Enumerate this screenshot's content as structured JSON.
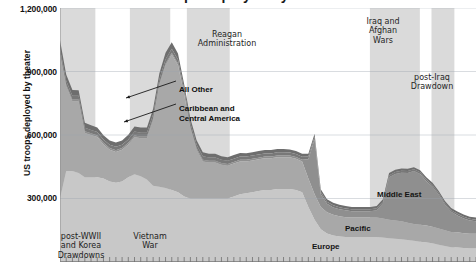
{
  "chart_data": {
    "type": "area",
    "title": "US troops deployed by theater",
    "subtitle": "",
    "xlabel": "",
    "ylabel": "US troops deployed by theater",
    "ylim": [
      0,
      1200000
    ],
    "yticks": [
      1200000,
      900000,
      600000,
      300000
    ],
    "ytick_labels": [
      "1,200,000",
      "900,000",
      "600,000",
      "300,000"
    ],
    "grid": true,
    "legend_position": "inline-labels",
    "stacked": true,
    "x": [
      1950,
      1951,
      1952,
      1953,
      1954,
      1955,
      1956,
      1957,
      1958,
      1959,
      1960,
      1961,
      1962,
      1963,
      1964,
      1965,
      1966,
      1967,
      1968,
      1969,
      1970,
      1971,
      1972,
      1973,
      1974,
      1975,
      1976,
      1977,
      1978,
      1979,
      1980,
      1981,
      1982,
      1983,
      1984,
      1985,
      1986,
      1987,
      1988,
      1989,
      1990,
      1991,
      1992,
      1993,
      1994,
      1995,
      1996,
      1997,
      1998,
      1999,
      2000,
      2001,
      2002,
      2003,
      2004,
      2005,
      2006,
      2007,
      2008,
      2009,
      2010,
      2011,
      2012,
      2013,
      2014,
      2015,
      2016,
      2017
    ],
    "series": [
      {
        "name": "Europe",
        "color": "#c8c8c8",
        "values": [
          300000,
          430000,
          430000,
          420000,
          400000,
          400000,
          400000,
          395000,
          380000,
          375000,
          380000,
          400000,
          415000,
          405000,
          390000,
          360000,
          355000,
          350000,
          340000,
          330000,
          310000,
          300000,
          300000,
          300000,
          300000,
          300000,
          300000,
          300000,
          310000,
          320000,
          325000,
          330000,
          335000,
          340000,
          340000,
          345000,
          345000,
          345000,
          340000,
          330000,
          260000,
          200000,
          155000,
          135000,
          125000,
          120000,
          118000,
          118000,
          118000,
          118000,
          118000,
          118000,
          116000,
          112000,
          110000,
          108000,
          104000,
          100000,
          96000,
          92000,
          88000,
          82000,
          76000,
          70000,
          68000,
          66000,
          64000,
          64000
        ]
      },
      {
        "name": "Pacific",
        "color": "#a8a8a8",
        "values": [
          680000,
          400000,
          330000,
          340000,
          210000,
          200000,
          190000,
          160000,
          150000,
          145000,
          150000,
          155000,
          175000,
          180000,
          195000,
          310000,
          480000,
          580000,
          640000,
          600000,
          480000,
          330000,
          230000,
          175000,
          170000,
          170000,
          160000,
          155000,
          155000,
          155000,
          150000,
          150000,
          150000,
          150000,
          150000,
          150000,
          150000,
          150000,
          148000,
          145000,
          135000,
          120000,
          105000,
          100000,
          98000,
          96000,
          94000,
          92000,
          92000,
          92000,
          92000,
          92000,
          90000,
          88000,
          86000,
          84000,
          82000,
          80000,
          80000,
          80000,
          78000,
          76000,
          74000,
          72000,
          72000,
          70000,
          70000,
          70000
        ]
      },
      {
        "name": "Middle East",
        "color": "#8f8f8f",
        "values": [
          8000,
          8000,
          8000,
          8000,
          8000,
          8000,
          8000,
          8000,
          8000,
          8000,
          8000,
          8000,
          8000,
          8000,
          8000,
          8000,
          8000,
          8000,
          8000,
          8000,
          8000,
          8000,
          8000,
          8000,
          8000,
          8000,
          8000,
          8000,
          8000,
          8000,
          8000,
          8000,
          8000,
          8000,
          8000,
          8000,
          8000,
          8000,
          8000,
          8000,
          90000,
          260000,
          60000,
          40000,
          35000,
          33000,
          32000,
          30000,
          30000,
          30000,
          30000,
          35000,
          70000,
          200000,
          220000,
          230000,
          235000,
          250000,
          240000,
          210000,
          190000,
          160000,
          120000,
          95000,
          80000,
          70000,
          62000,
          58000
        ]
      },
      {
        "name": "Caribbean and Central America",
        "color": "#787878",
        "values": [
          18000,
          18000,
          17000,
          17000,
          16000,
          16000,
          16000,
          16000,
          16000,
          16000,
          16000,
          16000,
          18000,
          18000,
          18000,
          20000,
          20000,
          20000,
          20000,
          19000,
          18000,
          18000,
          17000,
          17000,
          16000,
          16000,
          15000,
          15000,
          15000,
          15000,
          15000,
          15000,
          15000,
          15000,
          15000,
          15000,
          15000,
          14000,
          14000,
          14000,
          13000,
          12000,
          11000,
          10000,
          10000,
          10000,
          9000,
          9000,
          9000,
          9000,
          9000,
          9000,
          9000,
          9000,
          9000,
          9000,
          9000,
          8000,
          8000,
          8000,
          8000,
          8000,
          8000,
          8000,
          8000,
          8000,
          8000,
          8000
        ]
      },
      {
        "name": "All Other",
        "color": "#6e6e6e",
        "values": [
          42000,
          30000,
          28000,
          26000,
          24000,
          22000,
          22000,
          20000,
          20000,
          20000,
          20000,
          22000,
          24000,
          24000,
          24000,
          26000,
          28000,
          30000,
          30000,
          28000,
          24000,
          22000,
          20000,
          18000,
          18000,
          18000,
          17000,
          17000,
          17000,
          17000,
          16000,
          16000,
          16000,
          16000,
          16000,
          16000,
          16000,
          15000,
          15000,
          15000,
          14000,
          14000,
          13000,
          12000,
          12000,
          12000,
          11000,
          11000,
          11000,
          11000,
          11000,
          11000,
          11000,
          11000,
          11000,
          11000,
          11000,
          10000,
          10000,
          10000,
          10000,
          10000,
          10000,
          10000,
          10000,
          10000,
          10000,
          10000
        ]
      }
    ],
    "era_bands": [
      {
        "label": "post-WWII\nand Korea\nDrawdowns",
        "x0": 0.0,
        "x1": 0.085
      },
      {
        "label": "Vietnam\nWar",
        "x0": 0.168,
        "x1": 0.265
      },
      {
        "label": "Reagan\nAdministration",
        "x0": 0.305,
        "x1": 0.408
      },
      {
        "label": "Iraq and\nAfghan\nWars",
        "x0": 0.745,
        "x1": 0.865
      },
      {
        "label": "post-Iraq\nDrawdown",
        "x0": 0.893,
        "x1": 0.948
      }
    ],
    "annotations": [
      {
        "text": "All Other",
        "target_series": "All Other"
      },
      {
        "text": "Caribbean and\nCentral America",
        "target_series": "Caribbean and Central America"
      }
    ],
    "colors": {
      "band_fill": "#d4d4d4",
      "gridline": "#9aa3ad",
      "axis": "#8c8c8c",
      "text": "#141414"
    }
  }
}
